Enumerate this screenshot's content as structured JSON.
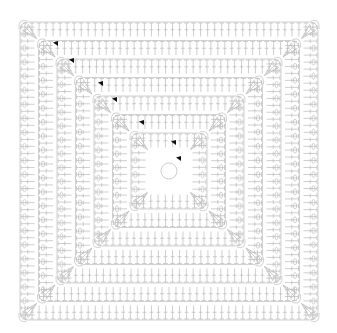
{
  "diagram": {
    "type": "crochet-granny-square-chart",
    "center": [
      169,
      171
    ],
    "ring_radius": 8,
    "rounds": 7,
    "round_spacing": 21.5,
    "outer_bounds": {
      "left": 18,
      "top": 24,
      "right": 320,
      "bottom": 318
    },
    "colors": {
      "background": "#ffffff",
      "stitch": "#b9b9b9",
      "marker": "#111111"
    },
    "round_start_markers": [
      {
        "x": 57,
        "y": 44
      },
      {
        "x": 73,
        "y": 61
      },
      {
        "x": 102,
        "y": 84
      },
      {
        "x": 116,
        "y": 100
      },
      {
        "x": 143,
        "y": 123
      },
      {
        "x": 175,
        "y": 143
      },
      {
        "x": 180,
        "y": 159
      }
    ],
    "symbols": [
      "magic-ring",
      "chain-loop",
      "double-crochet",
      "corner-cluster",
      "round-start-arrow"
    ]
  }
}
